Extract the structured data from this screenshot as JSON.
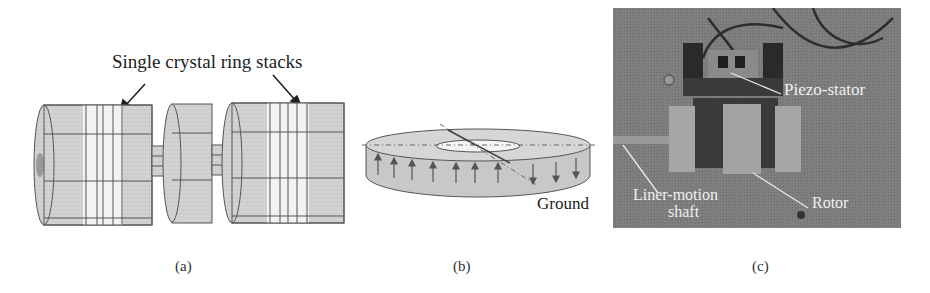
{
  "figure": {
    "panels": [
      {
        "id": "a",
        "caption": "(a)",
        "description": "3D model of motor with two single crystal ring stacks on a shaft",
        "annotation": "Single crystal ring stacks"
      },
      {
        "id": "b",
        "caption": "(b)",
        "description": "Single crystal ring with polarization arrows (up on left, down on right)",
        "annotation": "Ground"
      },
      {
        "id": "c",
        "caption": "(c)",
        "description": "Photograph of prototype motor",
        "annotations": [
          "Piezo-stator",
          "Liner-motion",
          "shaft",
          "Rotor"
        ]
      }
    ]
  },
  "colors": {
    "model_fill": "#cfcfcf",
    "model_stroke": "#555555",
    "ring_band": "#f2f2f2",
    "photo_bg": "#7d7d7d",
    "photo_dark": "#2e2e2e",
    "photo_block": "#a6a6a6",
    "photo_text": "#f0f0f0"
  }
}
